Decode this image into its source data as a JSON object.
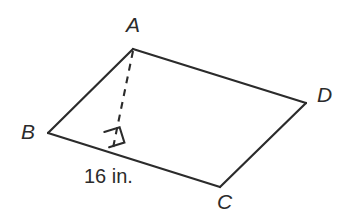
{
  "figure": {
    "kind": "parallelogram-with-height",
    "background_color": "#ffffff",
    "stroke_color": "#2b2b2b",
    "text_color": "#2b2b2b",
    "stroke_width": 2,
    "dash_pattern": "7 6",
    "vertices": [
      {
        "name": "A",
        "label": "A",
        "x": 133,
        "y": 49
      },
      {
        "name": "B",
        "label": "B",
        "x": 48,
        "y": 133
      },
      {
        "name": "C",
        "label": "C",
        "x": 220,
        "y": 187
      },
      {
        "name": "D",
        "label": "D",
        "x": 306,
        "y": 103
      }
    ],
    "edges": [
      {
        "name": "edge-AB",
        "from": "A",
        "to": "B",
        "style": "solid"
      },
      {
        "name": "edge-BC",
        "from": "B",
        "to": "C",
        "style": "solid"
      },
      {
        "name": "edge-CD",
        "from": "C",
        "to": "D",
        "style": "solid"
      },
      {
        "name": "edge-DA",
        "from": "D",
        "to": "A",
        "style": "solid"
      }
    ],
    "height_segment": {
      "name": "height-from-A",
      "from": "A",
      "foot": {
        "x": 113,
        "y": 148
      },
      "style": "dashed"
    },
    "right_angle_marker": {
      "name": "right-angle-marker",
      "points": "104.5,132.5 119.2,127.9 123.8,142.6 109.1,147.2",
      "at_vertex": "foot-of-height"
    },
    "measurements": [
      {
        "name": "base-length",
        "label": "16 in.",
        "value": 16,
        "unit": "in.",
        "applies_to": "edge-BC"
      }
    ]
  }
}
